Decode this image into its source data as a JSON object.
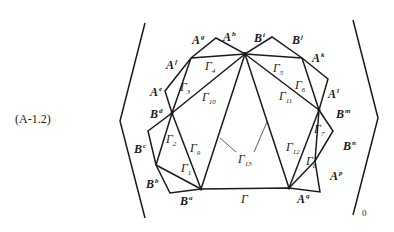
{
  "equation_label": "(A-1.2)",
  "bracket_subscript": "0",
  "vertices": [
    {
      "id": "hub_top",
      "x": 245,
      "y": 54
    },
    {
      "id": "Ag_peak",
      "x": 216,
      "y": 38
    },
    {
      "id": "Af",
      "x": 191,
      "y": 58
    },
    {
      "id": "Ae_corner",
      "x": 165,
      "y": 91
    },
    {
      "id": "Bd",
      "x": 172,
      "y": 113
    },
    {
      "id": "Bc_corner",
      "x": 148,
      "y": 131
    },
    {
      "id": "Bb",
      "x": 156,
      "y": 165
    },
    {
      "id": "Ba_corner",
      "x": 170,
      "y": 193
    },
    {
      "id": "hub_bl",
      "x": 201,
      "y": 189
    },
    {
      "id": "hub_br",
      "x": 289,
      "y": 188
    },
    {
      "id": "Aq_corner",
      "x": 320,
      "y": 192
    },
    {
      "id": "Ap",
      "x": 315,
      "y": 161
    },
    {
      "id": "Bn_corner",
      "x": 333,
      "y": 131
    },
    {
      "id": "Bm",
      "x": 319,
      "y": 110
    },
    {
      "id": "Al_corner",
      "x": 328,
      "y": 79
    },
    {
      "id": "Ak",
      "x": 302,
      "y": 58
    },
    {
      "id": "Bi_peak",
      "x": 272,
      "y": 37
    }
  ],
  "point_labels": [
    {
      "base": "A",
      "sup": "g",
      "x": 192,
      "y": 44
    },
    {
      "base": "A",
      "sup": "h",
      "x": 223,
      "y": 41
    },
    {
      "base": "B",
      "sup": "i",
      "x": 254,
      "y": 42
    },
    {
      "base": "B",
      "sup": "j",
      "x": 292,
      "y": 44
    },
    {
      "base": "A",
      "sup": "f",
      "x": 166,
      "y": 69
    },
    {
      "base": "A",
      "sup": "k",
      "x": 312,
      "y": 62
    },
    {
      "base": "A",
      "sup": "e",
      "x": 150,
      "y": 96
    },
    {
      "base": "A",
      "sup": "l",
      "x": 328,
      "y": 98
    },
    {
      "base": "B",
      "sup": "d",
      "x": 150,
      "y": 118
    },
    {
      "base": "B",
      "sup": "m",
      "x": 336,
      "y": 118
    },
    {
      "base": "B",
      "sup": "c",
      "x": 134,
      "y": 153
    },
    {
      "base": "B",
      "sup": "n",
      "x": 343,
      "y": 150
    },
    {
      "base": "B",
      "sup": "b",
      "x": 146,
      "y": 188
    },
    {
      "base": "A",
      "sup": "p",
      "x": 330,
      "y": 180
    },
    {
      "base": "B",
      "sup": "a",
      "x": 180,
      "y": 205
    },
    {
      "base": "A",
      "sup": "q",
      "x": 297,
      "y": 203
    }
  ],
  "gamma_labels": [
    {
      "base": "Γ",
      "sub": "1",
      "x": 181,
      "y": 172
    },
    {
      "base": "Γ",
      "sub": "2",
      "x": 166,
      "y": 143
    },
    {
      "base": "Γ",
      "sub": "3",
      "x": 180,
      "y": 91
    },
    {
      "base": "Γ",
      "sub": "4",
      "x": 205,
      "y": 70
    },
    {
      "base": "Γ",
      "sub": "5",
      "x": 273,
      "y": 72
    },
    {
      "base": "Γ",
      "sub": "6",
      "x": 295,
      "y": 89
    },
    {
      "base": "Γ",
      "sub": "7",
      "x": 314,
      "y": 133
    },
    {
      "base": "Γ",
      "sub": "8",
      "x": 306,
      "y": 165
    },
    {
      "base": "Γ",
      "sub": "9",
      "x": 190,
      "y": 152
    },
    {
      "base": "Γ",
      "sub": "10",
      "x": 202,
      "y": 101
    },
    {
      "base": "Γ",
      "sub": "11",
      "x": 279,
      "y": 100
    },
    {
      "base": "Γ",
      "sub": "12",
      "x": 286,
      "y": 151
    },
    {
      "base": "Γ",
      "sub": "13",
      "x": 238,
      "y": 163
    },
    {
      "base": "Γ",
      "sub": "",
      "x": 241,
      "y": 203
    }
  ]
}
